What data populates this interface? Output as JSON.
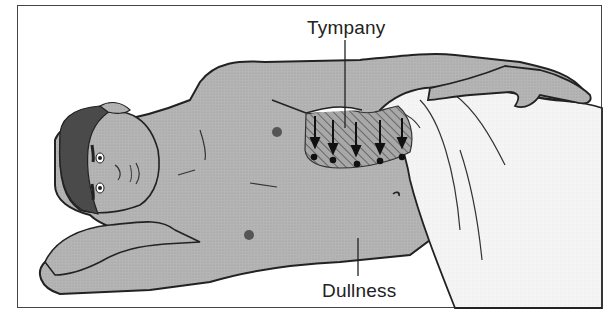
{
  "figure": {
    "labels": {
      "top": "Tympany",
      "bottom": "Dullness"
    },
    "colors": {
      "skin": "#b3b3b3",
      "hair": "#555555",
      "sheet": "#f2f2f2",
      "outline": "#222222",
      "hatch_region": "#9a9a9a",
      "border": "#444444"
    },
    "arrows": {
      "count": 5,
      "direction": "down",
      "meaning": "fluid shifts to dependent side"
    }
  }
}
